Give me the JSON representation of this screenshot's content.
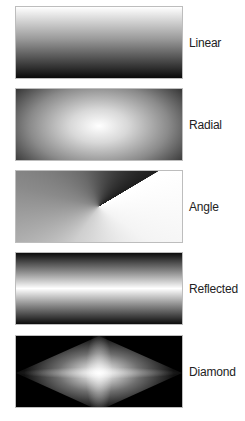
{
  "gradients": [
    {
      "id": "linear",
      "label": "Linear",
      "type": "linear",
      "colors": [
        "#ffffff",
        "#000000"
      ]
    },
    {
      "id": "radial",
      "label": "Radial",
      "type": "radial",
      "colors": [
        "#ffffff",
        "#000000"
      ]
    },
    {
      "id": "angle",
      "label": "Angle",
      "type": "angle",
      "colors": [
        "#ffffff",
        "#000000"
      ]
    },
    {
      "id": "reflected",
      "label": "Reflected",
      "type": "reflected",
      "colors": [
        "#ffffff",
        "#000000"
      ]
    },
    {
      "id": "diamond",
      "label": "Diamond",
      "type": "diamond",
      "colors": [
        "#ffffff",
        "#000000"
      ]
    }
  ]
}
